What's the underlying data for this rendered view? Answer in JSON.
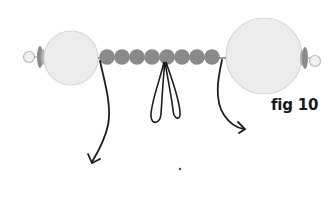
{
  "figure": {
    "label": "fig 10",
    "colors": {
      "large_bead": "#ececec",
      "large_bead_stroke": "#d6d6d6",
      "small_bead": "#8a8a8a",
      "cap": "#7a7a7a",
      "cord": "#1e1e1e"
    },
    "components": {
      "small_beads_count": 8,
      "large_beads_count": 2,
      "loops_count": 2,
      "arrows_count": 2
    }
  }
}
